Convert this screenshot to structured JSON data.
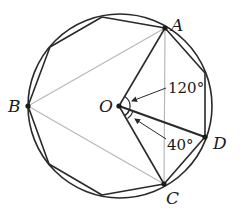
{
  "diagram": {
    "type": "geometry",
    "colors": {
      "stroke": "#2a2a2a",
      "light_stroke": "#b8b8b8",
      "point": "#1a1a1a"
    },
    "circle": {
      "center": [
        120,
        106
      ],
      "radius": 92
    },
    "points": {
      "A": {
        "label": "A",
        "x": 165,
        "y": 28
      },
      "B": {
        "label": "B",
        "x": 28,
        "y": 106
      },
      "C": {
        "label": "C",
        "x": 164,
        "y": 184
      },
      "D": {
        "label": "D",
        "x": 205,
        "y": 137
      },
      "O": {
        "label": "O",
        "x": 119,
        "y": 106
      }
    },
    "angles": {
      "AOC": {
        "label": "120°",
        "value": 120
      },
      "COD": {
        "label": "40°",
        "value": 40
      }
    }
  }
}
